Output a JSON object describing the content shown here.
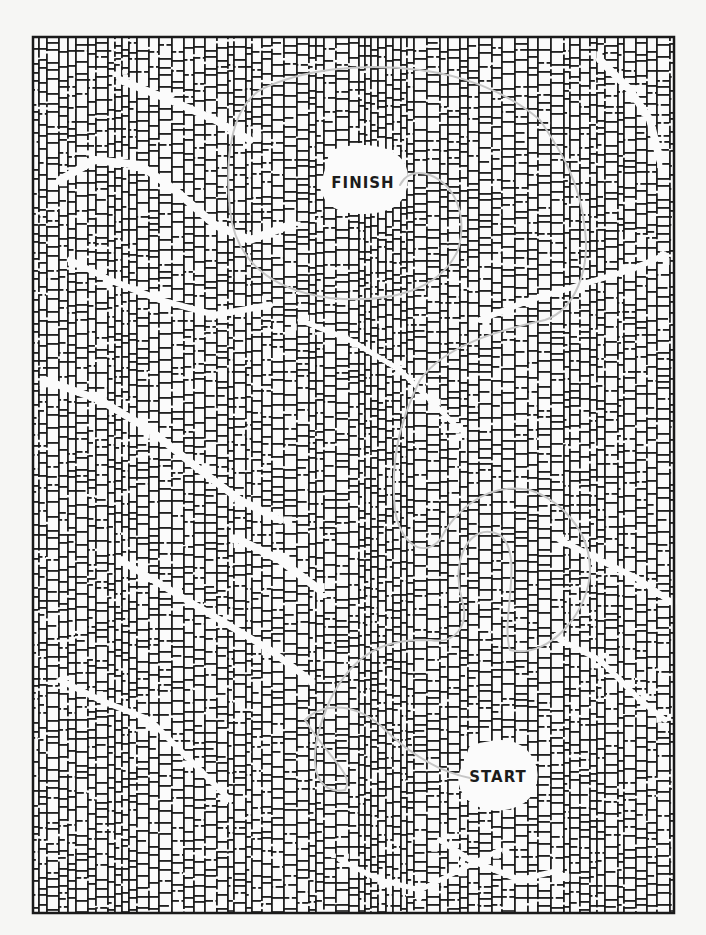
{
  "page": {
    "width": 706,
    "height": 935,
    "background": "#f6f6f4"
  },
  "maze": {
    "frame": {
      "x": 33,
      "y": 37,
      "width": 641,
      "height": 876
    },
    "wall_color": "#1a1a1a",
    "cell_fill": "#fbfbfb",
    "seed": 7919,
    "finish": {
      "label": "FINISH",
      "label_pos": [
        363,
        183
      ],
      "clearing": [
        [
          330,
          150
        ],
        [
          360,
          143
        ],
        [
          395,
          150
        ],
        [
          410,
          170
        ],
        [
          405,
          200
        ],
        [
          385,
          213
        ],
        [
          345,
          215
        ],
        [
          322,
          200
        ],
        [
          318,
          175
        ]
      ]
    },
    "start": {
      "label": "START",
      "label_pos": [
        498,
        777
      ],
      "clearing": [
        [
          470,
          745
        ],
        [
          505,
          738
        ],
        [
          528,
          748
        ],
        [
          540,
          772
        ],
        [
          532,
          800
        ],
        [
          505,
          812
        ],
        [
          475,
          808
        ],
        [
          458,
          790
        ],
        [
          458,
          762
        ]
      ]
    },
    "corridors": [
      [
        [
          60,
          180
        ],
        [
          95,
          160
        ],
        [
          140,
          165
        ],
        [
          175,
          190
        ],
        [
          215,
          225
        ],
        [
          250,
          240
        ],
        [
          290,
          225
        ]
      ],
      [
        [
          70,
          260
        ],
        [
          110,
          280
        ],
        [
          160,
          300
        ],
        [
          215,
          315
        ],
        [
          270,
          305
        ]
      ],
      [
        [
          45,
          380
        ],
        [
          100,
          400
        ],
        [
          150,
          430
        ],
        [
          200,
          470
        ],
        [
          240,
          500
        ],
        [
          280,
          520
        ]
      ],
      [
        [
          300,
          320
        ],
        [
          350,
          340
        ],
        [
          400,
          370
        ],
        [
          430,
          400
        ],
        [
          460,
          430
        ]
      ],
      [
        [
          480,
          320
        ],
        [
          530,
          300
        ],
        [
          580,
          285
        ],
        [
          630,
          270
        ],
        [
          665,
          255
        ]
      ],
      [
        [
          600,
          60
        ],
        [
          630,
          90
        ],
        [
          650,
          120
        ],
        [
          660,
          160
        ]
      ],
      [
        [
          120,
          560
        ],
        [
          170,
          590
        ],
        [
          220,
          620
        ],
        [
          270,
          650
        ],
        [
          310,
          680
        ]
      ],
      [
        [
          560,
          540
        ],
        [
          600,
          560
        ],
        [
          640,
          580
        ],
        [
          668,
          600
        ]
      ],
      [
        [
          60,
          680
        ],
        [
          100,
          700
        ],
        [
          150,
          720
        ],
        [
          190,
          760
        ],
        [
          230,
          800
        ]
      ],
      [
        [
          340,
          860
        ],
        [
          380,
          880
        ],
        [
          420,
          890
        ],
        [
          460,
          870
        ],
        [
          500,
          850
        ]
      ],
      [
        [
          560,
          640
        ],
        [
          600,
          660
        ],
        [
          640,
          700
        ],
        [
          665,
          720
        ]
      ],
      [
        [
          240,
          540
        ],
        [
          280,
          560
        ],
        [
          320,
          590
        ]
      ],
      [
        [
          120,
          80
        ],
        [
          170,
          100
        ],
        [
          215,
          120
        ],
        [
          250,
          140
        ]
      ],
      [
        [
          440,
          840
        ],
        [
          470,
          860
        ],
        [
          520,
          880
        ],
        [
          560,
          870
        ]
      ]
    ],
    "solution_path": {
      "color": "#c6c6c6",
      "width": 2,
      "d": "M 470 778 C 430 770, 400 745, 380 725 C 350 700, 320 705, 305 720 C 330 760, 355 775, 345 790 C 320 795, 300 770, 330 700 C 360 640, 400 640, 430 640 C 455 645, 470 625, 462 600 C 450 560, 470 520, 500 535 C 525 555, 500 620, 510 650 C 550 660, 590 610, 590 570 C 590 530, 560 500, 530 490 C 480 480, 450 520, 440 540 C 420 560, 400 540, 395 510 C 390 460, 400 420, 420 380 C 445 345, 500 330, 545 320 C 575 310, 590 270, 585 230 C 580 180, 560 150, 540 120 C 505 90, 460 75, 420 70 C 360 62, 300 70, 260 90 C 230 110, 225 160, 230 210 C 235 260, 270 290, 330 298 C 390 304, 440 290, 458 250 C 468 215, 455 185, 430 175 C 415 170, 405 175, 400 185"
    }
  }
}
